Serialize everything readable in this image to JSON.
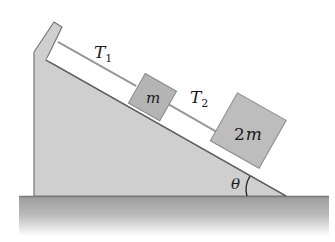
{
  "diagram": {
    "type": "inclined-plane-pulley-free",
    "labels": {
      "tension_1": "T",
      "tension_1_sub": "1",
      "tension_2": "T",
      "tension_2_sub": "2",
      "block_small": "m",
      "block_large_coef": "2",
      "block_large_var": "m",
      "angle": "θ"
    },
    "colors": {
      "wedge_fill": "#cfcfcf",
      "wedge_edge": "#777777",
      "block_fill": "#b4b4b4",
      "block_edge": "#8a8a8a",
      "rope": "#9a9a9a",
      "ground_top": "#9c9c9c",
      "ground_fade": "#ffffff",
      "text": "#1a1a1a"
    }
  }
}
